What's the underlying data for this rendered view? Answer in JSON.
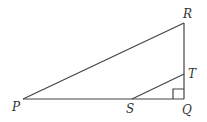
{
  "diagram": {
    "type": "geometry-figure",
    "points": {
      "P": {
        "label": "P",
        "x": 23,
        "y": 99
      },
      "Q": {
        "label": "Q",
        "x": 184,
        "y": 99
      },
      "R": {
        "label": "R",
        "x": 184,
        "y": 23
      },
      "S": {
        "label": "S",
        "x": 132,
        "y": 99
      },
      "T": {
        "label": "T",
        "x": 184,
        "y": 74
      }
    },
    "segments": [
      "PQ",
      "QR",
      "PR",
      "ST"
    ],
    "right_angle_at": "Q",
    "line_color": "#444444"
  }
}
